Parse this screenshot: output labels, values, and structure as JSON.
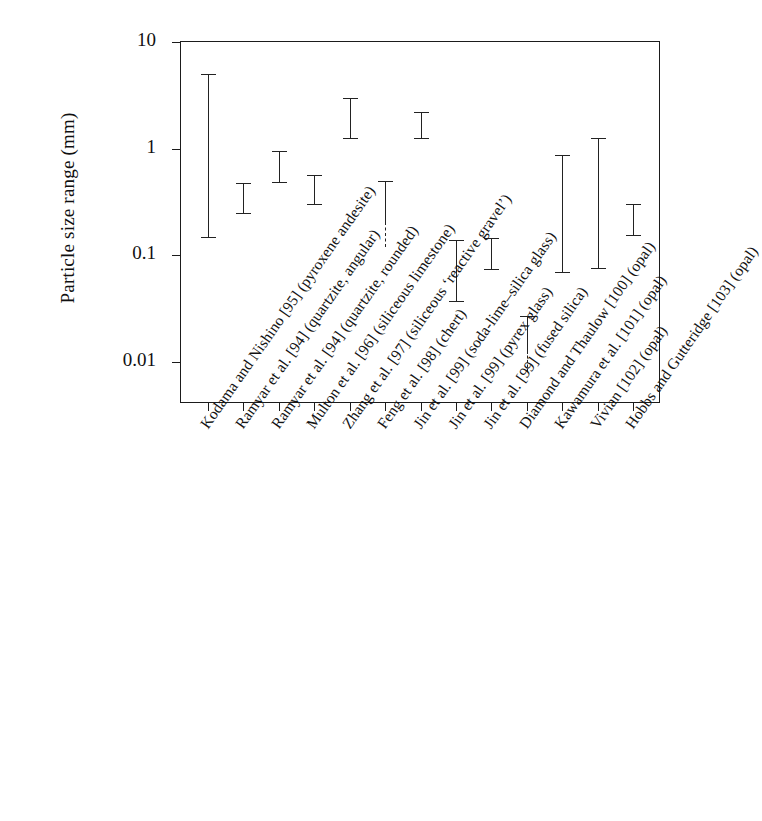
{
  "chart_data": {
    "type": "bar",
    "title": "",
    "xlabel": "",
    "ylabel": "Particle size range (mm)",
    "yscale": "log",
    "ylim": [
      0.005,
      10
    ],
    "ytick_labels": [
      "10",
      "1",
      "0.1",
      "0.01"
    ],
    "ytick_values": [
      10,
      1,
      0.1,
      0.01
    ],
    "grid": false,
    "legend": "none",
    "categories": [
      "Kodama and Nishino [95] (pyroxene andesite)",
      "Ramyar et al. [94] (quartzite, angular)",
      "Ramyar et al. [94] (quartzite, rounded)",
      "Multon et al. [96] (siliceous limestone)",
      "Zhang et al. [97] (siliceous ‘reactive gravel’)",
      "Feng et al. [98] (chert)",
      "Jin et al. [99] (soda-lime–silica glass)",
      "Jin et al. [99] (pyrex glass)",
      "Jin et al. [99] (fused silica)",
      "Diamond and Thaulow [100] (opal)",
      "Kawamura et al. [101] (opal)",
      "Vivian [102] (opal)",
      "Hobbs and Gutteridge [103] (opal)"
    ],
    "ranges": [
      {
        "category": "Kodama and Nishino [95] (pyroxene andesite)",
        "min": 0.15,
        "max": 5.0,
        "open_lower": false
      },
      {
        "category": "Ramyar et al. [94] (quartzite, angular)",
        "min": 0.25,
        "max": 0.48,
        "open_lower": false
      },
      {
        "category": "Ramyar et al. [94] (quartzite, rounded)",
        "min": 0.49,
        "max": 0.96,
        "open_lower": false
      },
      {
        "category": "Multon et al. [96] (siliceous limestone)",
        "min": 0.3,
        "max": 0.57,
        "open_lower": false
      },
      {
        "category": "Zhang et al. [97] (siliceous ‘reactive gravel’)",
        "min": 1.25,
        "max": 3.0,
        "open_lower": false
      },
      {
        "category": "Feng et al. [98] (chert)",
        "min": 0.12,
        "max": 0.5,
        "open_lower": true
      },
      {
        "category": "Jin et al. [99] (soda-lime–silica glass)",
        "min": 1.25,
        "max": 2.2,
        "open_lower": false
      },
      {
        "category": "Jin et al. [99] (pyrex glass)",
        "min": 0.037,
        "max": 0.14,
        "open_lower": false
      },
      {
        "category": "Jin et al. [99] (fused silica)",
        "min": 0.074,
        "max": 0.145,
        "open_lower": false
      },
      {
        "category": "Diamond and Thaulow [100] (opal)",
        "min": 0.008,
        "max": 0.027,
        "open_lower": true
      },
      {
        "category": "Kawamura et al. [101] (opal)",
        "min": 0.07,
        "max": 0.87,
        "open_lower": false
      },
      {
        "category": "Vivian [102] (opal)",
        "min": 0.077,
        "max": 1.25,
        "open_lower": false
      },
      {
        "category": "Hobbs and Gutteridge [103] (opal)",
        "min": 0.155,
        "max": 0.3,
        "open_lower": false
      }
    ]
  },
  "axis": {
    "y_title": "Particle size range (mm)",
    "y_ticks": [
      "10",
      "1",
      "0.1",
      "0.01"
    ]
  },
  "colors": {
    "axis": "#1b1b1b",
    "bar": "#222222",
    "background": "#ffffff",
    "text": "#101010"
  }
}
